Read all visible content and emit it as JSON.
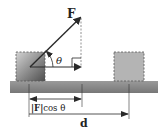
{
  "diagram": {
    "labels": {
      "force": "F",
      "angle": "θ",
      "component_bar": "|F|",
      "component_rest": "cos θ",
      "displacement": "d"
    },
    "colors": {
      "ground": "#8a8a8a",
      "box_initial_dark": "#5e5e5e",
      "box_initial_light": "#c9c9c9",
      "box_final": "#b4b4b4",
      "line": "#2a2a2a",
      "dashed": "#777777"
    }
  }
}
